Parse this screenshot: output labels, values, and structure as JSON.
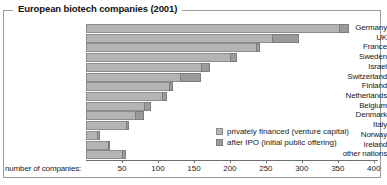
{
  "title": "European biotech companies (2001)",
  "axis_title": "number of companies:",
  "legend": {
    "items": [
      {
        "label": "privately financed (venture capital)",
        "color": "#b4b4b4",
        "key": "private"
      },
      {
        "label": "after IPO (initial public offering)",
        "color": "#9b9b9b",
        "key": "ipo"
      }
    ]
  },
  "colors": {
    "private": "#b4b4b4",
    "ipo": "#9b9b9b",
    "frame": "#9a9a9a",
    "axis": "#6e6e6e"
  },
  "chart_data": {
    "type": "bar",
    "orientation": "horizontal",
    "stacked": true,
    "title": "European biotech companies (2001)",
    "xlabel": "number of companies:",
    "ylabel": "",
    "xlim": [
      0,
      415
    ],
    "grid": false,
    "legend_position": "inside-bottom-right",
    "ticks": [
      50,
      100,
      150,
      200,
      250,
      300,
      350,
      400
    ],
    "categories": [
      "Germany",
      "UK",
      "France",
      "Sweden",
      "Israel",
      "Switzerland",
      "Finland",
      "Netherlands",
      "Belgium",
      "Denmark",
      "Italy",
      "Norway",
      "Ireland",
      "other nations"
    ],
    "series": [
      {
        "name": "privately financed (venture capital)",
        "values": [
          352,
          258,
          236,
          200,
          160,
          130,
          115,
          105,
          80,
          68,
          55,
          15,
          30,
          50
        ]
      },
      {
        "name": "after IPO (initial public offering)",
        "values": [
          13,
          38,
          6,
          10,
          12,
          30,
          6,
          7,
          10,
          12,
          5,
          4,
          4,
          6
        ]
      }
    ],
    "totals": [
      365,
      296,
      242,
      210,
      172,
      160,
      121,
      112,
      90,
      80,
      60,
      19,
      34,
      56
    ]
  }
}
